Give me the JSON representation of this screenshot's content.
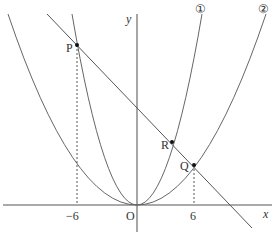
{
  "diagram": {
    "type": "coordinate-plane-parabolas",
    "axes": {
      "x_label": "x",
      "y_label": "y",
      "origin_label": "O"
    },
    "ticks": [
      {
        "label": "−6",
        "value": -6
      },
      {
        "label": "6",
        "value": 6
      }
    ],
    "curves": [
      {
        "id": "curve-1",
        "label": "①"
      },
      {
        "id": "curve-2",
        "label": "②"
      }
    ],
    "points": [
      {
        "id": "P",
        "label": "P"
      },
      {
        "id": "Q",
        "label": "Q"
      },
      {
        "id": "R",
        "label": "R"
      }
    ],
    "colors": {
      "stroke": "#555555",
      "text": "#333333"
    }
  }
}
